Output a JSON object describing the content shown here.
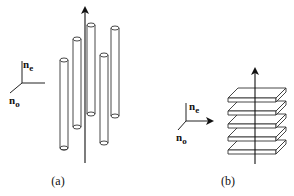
{
  "figure": {
    "panels": [
      {
        "id": "a",
        "caption": "(a)",
        "structure": "vertical cylinders (rods)",
        "rod_count": 5,
        "axes": {
          "vertical_label": "n",
          "vertical_subscript": "e",
          "diagonal_label": "n",
          "diagonal_subscript": "o"
        }
      },
      {
        "id": "b",
        "caption": "(b)",
        "structure": "stacked horizontal plates (layers)",
        "plate_count": 5,
        "axes": {
          "vertical_label": "n",
          "vertical_subscript": "e",
          "diagonal_label": "n",
          "diagonal_subscript": "o"
        }
      }
    ]
  }
}
